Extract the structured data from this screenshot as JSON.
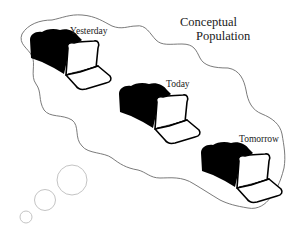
{
  "title": {
    "line1": "Conceptual",
    "line2": "Population"
  },
  "loaves": [
    {
      "label": "Yesterday",
      "icon": "bread-loaf-icon"
    },
    {
      "label": "Today",
      "icon": "bread-loaf-icon"
    },
    {
      "label": "Tomorrow",
      "icon": "bread-loaf-icon"
    }
  ],
  "thought_bubbles": 3,
  "colors": {
    "outline": "#6b6b6b",
    "bubble": "#c4c4c4",
    "ink": "#000000",
    "background": "#ffffff"
  }
}
